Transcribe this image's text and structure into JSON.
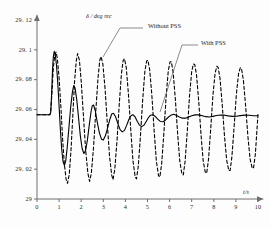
{
  "chart_data": {
    "type": "line",
    "title": "",
    "xlabel": "t/s",
    "ylabel": "δ / deg rec",
    "xlim": [
      0,
      10
    ],
    "ylim": [
      29,
      29.12
    ],
    "grid": false,
    "legend_position": "inline-annotations",
    "xticks": [
      "0",
      "1",
      "2",
      "3",
      "4",
      "5",
      "6",
      "7",
      "8",
      "9",
      "10"
    ],
    "xtick_values": [
      0,
      1,
      2,
      3,
      4,
      5,
      6,
      7,
      8,
      9,
      10
    ],
    "yticks": [
      "29",
      "29. 02",
      "29. 04",
      "29. 06",
      "29. 08",
      "29. 1",
      "29. 12"
    ],
    "ytick_values": [
      29,
      29.02,
      29.04,
      29.06,
      29.08,
      29.1,
      29.12
    ],
    "annotations": [
      {
        "text": "Without PSS",
        "label_x": 148,
        "label_y": 26,
        "leader": [
          [
            143,
            28
          ],
          [
            120,
            28
          ],
          [
            103,
            57
          ]
        ]
      },
      {
        "text": "With PSS",
        "label_x": 201,
        "label_y": 43,
        "leader": [
          [
            198,
            45
          ],
          [
            182,
            45
          ],
          [
            160,
            112
          ]
        ]
      }
    ],
    "series": [
      {
        "name": "With PSS",
        "style": "solid",
        "color": "#000000",
        "width": 1.1,
        "description": "Well-damped oscillation settling to steady state near 29.057",
        "steady_state": 29.057,
        "disturbance_time": 0.62,
        "points": [
          [
            0.0,
            29.0565
          ],
          [
            0.1,
            29.0565
          ],
          [
            0.2,
            29.0565
          ],
          [
            0.3,
            29.0565
          ],
          [
            0.4,
            29.0565
          ],
          [
            0.5,
            29.0565
          ],
          [
            0.58,
            29.0565
          ],
          [
            0.62,
            29.058
          ],
          [
            0.66,
            29.07
          ],
          [
            0.7,
            29.086
          ],
          [
            0.74,
            29.0955
          ],
          [
            0.78,
            29.099
          ],
          [
            0.82,
            29.0975
          ],
          [
            0.88,
            29.09
          ],
          [
            0.94,
            29.078
          ],
          [
            1.0,
            29.062
          ],
          [
            1.06,
            29.046
          ],
          [
            1.12,
            29.033
          ],
          [
            1.18,
            29.025
          ],
          [
            1.24,
            29.0225
          ],
          [
            1.3,
            29.0255
          ],
          [
            1.36,
            29.0335
          ],
          [
            1.44,
            29.047
          ],
          [
            1.52,
            29.061
          ],
          [
            1.6,
            29.0715
          ],
          [
            1.66,
            29.076
          ],
          [
            1.72,
            29.0745
          ],
          [
            1.8,
            29.0665
          ],
          [
            1.88,
            29.0545
          ],
          [
            1.96,
            29.0425
          ],
          [
            2.04,
            29.034
          ],
          [
            2.12,
            29.0305
          ],
          [
            2.2,
            29.0325
          ],
          [
            2.28,
            29.0395
          ],
          [
            2.36,
            29.049
          ],
          [
            2.44,
            29.058
          ],
          [
            2.5,
            29.0625
          ],
          [
            2.56,
            29.063
          ],
          [
            2.64,
            29.059
          ],
          [
            2.72,
            29.052
          ],
          [
            2.82,
            29.0445
          ],
          [
            2.92,
            29.04
          ],
          [
            3.0,
            29.0395
          ],
          [
            3.1,
            29.0425
          ],
          [
            3.2,
            29.048
          ],
          [
            3.3,
            29.0535
          ],
          [
            3.38,
            29.057
          ],
          [
            3.46,
            29.0575
          ],
          [
            3.56,
            29.055
          ],
          [
            3.66,
            29.0505
          ],
          [
            3.76,
            29.0465
          ],
          [
            3.86,
            29.045
          ],
          [
            3.96,
            29.046
          ],
          [
            4.06,
            29.0495
          ],
          [
            4.16,
            29.0535
          ],
          [
            4.26,
            29.056
          ],
          [
            4.34,
            29.0565
          ],
          [
            4.44,
            29.055
          ],
          [
            4.54,
            29.052
          ],
          [
            4.64,
            29.0495
          ],
          [
            4.74,
            29.0485
          ],
          [
            4.84,
            29.0495
          ],
          [
            4.94,
            29.052
          ],
          [
            5.04,
            29.0545
          ],
          [
            5.14,
            29.0562
          ],
          [
            5.24,
            29.0565
          ],
          [
            5.34,
            29.0555
          ],
          [
            5.46,
            29.0535
          ],
          [
            5.58,
            29.052
          ],
          [
            5.7,
            29.0518
          ],
          [
            5.82,
            29.053
          ],
          [
            5.94,
            29.0548
          ],
          [
            6.06,
            29.0562
          ],
          [
            6.18,
            29.0568
          ],
          [
            6.3,
            29.0562
          ],
          [
            6.44,
            29.055
          ],
          [
            6.58,
            29.0542
          ],
          [
            6.72,
            29.0542
          ],
          [
            6.86,
            29.055
          ],
          [
            7.0,
            29.0558
          ],
          [
            7.16,
            29.0564
          ],
          [
            7.32,
            29.0564
          ],
          [
            7.48,
            29.0558
          ],
          [
            7.64,
            29.0552
          ],
          [
            7.8,
            29.055
          ],
          [
            7.96,
            29.0554
          ],
          [
            8.12,
            29.056
          ],
          [
            8.3,
            29.0563
          ],
          [
            8.48,
            29.0562
          ],
          [
            8.66,
            29.0557
          ],
          [
            8.84,
            29.0554
          ],
          [
            9.02,
            29.0555
          ],
          [
            9.2,
            29.0559
          ],
          [
            9.4,
            29.0562
          ],
          [
            9.6,
            29.0561
          ],
          [
            9.8,
            29.0558
          ],
          [
            10.0,
            29.0558
          ]
        ]
      },
      {
        "name": "Without PSS",
        "style": "dashed",
        "color": "#000000",
        "width": 1.1,
        "description": "Sustained, nearly undamped oscillation about 29.053 with amplitude about 0.038",
        "steady_state": 29.053,
        "disturbance_time": 0.62,
        "points": [
          [
            0.0,
            29.0565
          ],
          [
            0.15,
            29.0565
          ],
          [
            0.3,
            29.0565
          ],
          [
            0.45,
            29.0565
          ],
          [
            0.58,
            29.0565
          ],
          [
            0.62,
            29.0585
          ],
          [
            0.68,
            29.072
          ],
          [
            0.74,
            29.088
          ],
          [
            0.8,
            29.096
          ],
          [
            0.86,
            29.0985
          ],
          [
            0.92,
            29.0945
          ],
          [
            1.0,
            29.081
          ],
          [
            1.08,
            29.062
          ],
          [
            1.16,
            29.04
          ],
          [
            1.24,
            29.023
          ],
          [
            1.32,
            29.013
          ],
          [
            1.38,
            29.0105
          ],
          [
            1.46,
            29.0165
          ],
          [
            1.54,
            29.033
          ],
          [
            1.62,
            29.056
          ],
          [
            1.7,
            29.079
          ],
          [
            1.78,
            29.093
          ],
          [
            1.84,
            29.0975
          ],
          [
            1.92,
            29.093
          ],
          [
            2.0,
            29.079
          ],
          [
            2.1,
            29.056
          ],
          [
            2.2,
            29.033
          ],
          [
            2.3,
            29.0175
          ],
          [
            2.38,
            29.0118
          ],
          [
            2.46,
            29.0175
          ],
          [
            2.56,
            29.035
          ],
          [
            2.66,
            29.059
          ],
          [
            2.76,
            29.081
          ],
          [
            2.84,
            29.093
          ],
          [
            2.9,
            29.0955
          ],
          [
            2.98,
            29.0905
          ],
          [
            3.08,
            29.074
          ],
          [
            3.18,
            29.051
          ],
          [
            3.28,
            29.029
          ],
          [
            3.38,
            29.016
          ],
          [
            3.44,
            29.013
          ],
          [
            3.52,
            29.02
          ],
          [
            3.62,
            29.039
          ],
          [
            3.72,
            29.063
          ],
          [
            3.82,
            29.084
          ],
          [
            3.9,
            29.093
          ],
          [
            3.96,
            29.094
          ],
          [
            4.04,
            29.088
          ],
          [
            4.14,
            29.07
          ],
          [
            4.24,
            29.047
          ],
          [
            4.34,
            29.026
          ],
          [
            4.44,
            29.015
          ],
          [
            4.5,
            29.0135
          ],
          [
            4.58,
            29.0215
          ],
          [
            4.68,
            29.042
          ],
          [
            4.78,
            29.066
          ],
          [
            4.88,
            29.0855
          ],
          [
            4.96,
            29.0925
          ],
          [
            5.02,
            29.093
          ],
          [
            5.1,
            29.0865
          ],
          [
            5.2,
            29.069
          ],
          [
            5.3,
            29.046
          ],
          [
            5.4,
            29.0255
          ],
          [
            5.5,
            29.0155
          ],
          [
            5.56,
            29.0148
          ],
          [
            5.64,
            29.0235
          ],
          [
            5.74,
            29.044
          ],
          [
            5.84,
            29.068
          ],
          [
            5.94,
            29.086
          ],
          [
            6.02,
            29.092
          ],
          [
            6.08,
            29.092
          ],
          [
            6.16,
            29.085
          ],
          [
            6.26,
            29.067
          ],
          [
            6.36,
            29.0445
          ],
          [
            6.46,
            29.0255
          ],
          [
            6.56,
            29.0165
          ],
          [
            6.62,
            29.0162
          ],
          [
            6.7,
            29.025
          ],
          [
            6.8,
            29.0455
          ],
          [
            6.9,
            29.069
          ],
          [
            7.0,
            29.0855
          ],
          [
            7.08,
            29.0905
          ],
          [
            7.14,
            29.09
          ],
          [
            7.22,
            29.083
          ],
          [
            7.32,
            29.065
          ],
          [
            7.42,
            29.0435
          ],
          [
            7.52,
            29.0255
          ],
          [
            7.62,
            29.0175
          ],
          [
            7.68,
            29.0175
          ],
          [
            7.76,
            29.0265
          ],
          [
            7.86,
            29.047
          ],
          [
            7.96,
            29.0695
          ],
          [
            8.06,
            29.0845
          ],
          [
            8.14,
            29.089
          ],
          [
            8.2,
            29.088
          ],
          [
            8.28,
            29.081
          ],
          [
            8.38,
            29.0635
          ],
          [
            8.48,
            29.043
          ],
          [
            8.58,
            29.0262
          ],
          [
            8.68,
            29.019
          ],
          [
            8.74,
            29.0192
          ],
          [
            8.82,
            29.0285
          ],
          [
            8.92,
            29.0485
          ],
          [
            9.02,
            29.07
          ],
          [
            9.12,
            29.084
          ],
          [
            9.2,
            29.088
          ],
          [
            9.26,
            29.0868
          ],
          [
            9.34,
            29.0795
          ],
          [
            9.44,
            29.0625
          ],
          [
            9.54,
            29.0425
          ],
          [
            9.64,
            29.027
          ],
          [
            9.74,
            29.0205
          ],
          [
            9.8,
            29.021
          ],
          [
            9.88,
            29.03
          ],
          [
            9.96,
            29.048
          ],
          [
            10.0,
            29.057
          ]
        ]
      }
    ]
  }
}
